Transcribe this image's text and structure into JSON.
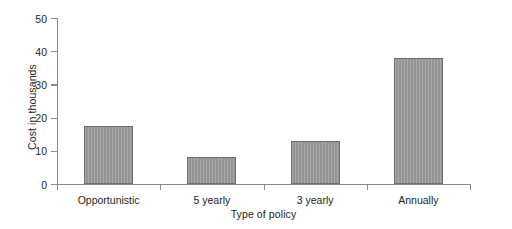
{
  "chart_data": {
    "type": "bar",
    "title": "",
    "xlabel": "Type of policy",
    "ylabel": "Cost in thousands",
    "categories": [
      "Opportunistic",
      "5 yearly",
      "3 yearly",
      "Annually"
    ],
    "values": [
      17.5,
      8.1,
      13.0,
      38.0
    ],
    "ylim": [
      0,
      50
    ],
    "yticks": [
      0,
      10,
      20,
      30,
      40,
      50
    ],
    "ytick_labels": [
      "0",
      "10",
      "20",
      "30",
      "40",
      "50"
    ],
    "grid": false,
    "legend": null,
    "series": [
      {
        "name": "Cost in thousands",
        "values": [
          17.5,
          8.1,
          13.0,
          38.0
        ],
        "color": "#9b9b9b",
        "edge_color": "#6e6e6e"
      }
    ]
  }
}
